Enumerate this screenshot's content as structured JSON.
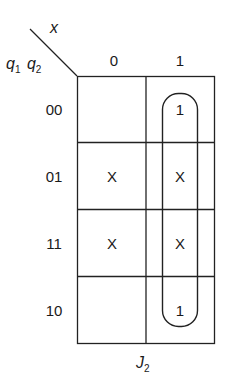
{
  "kmap": {
    "title": "J",
    "title_sub": "2",
    "col_var": "x",
    "row_var_1": "q",
    "row_var_1_sub": "1",
    "row_var_2": "q",
    "row_var_2_sub": "2",
    "col_headers": [
      "0",
      "1"
    ],
    "row_headers": [
      "00",
      "01",
      "11",
      "10"
    ],
    "cells": [
      [
        "",
        "1"
      ],
      [
        "X",
        "X"
      ],
      [
        "X",
        "X"
      ],
      [
        "",
        "1"
      ]
    ],
    "grouping": "column x=1, rows 00–10"
  }
}
